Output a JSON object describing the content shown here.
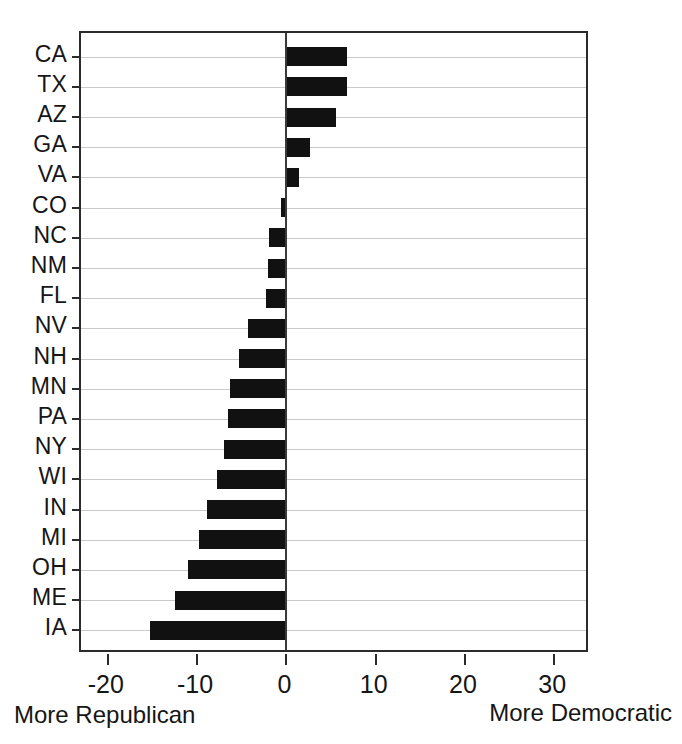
{
  "chart_data": {
    "type": "bar",
    "orientation": "horizontal",
    "title": "",
    "subtitle": "",
    "xlabel": "",
    "ylabel": "",
    "xlim": [
      -23,
      34
    ],
    "ylim": null,
    "grid": true,
    "legend": null,
    "xticks": [
      -20,
      -10,
      0,
      10,
      20,
      30
    ],
    "xticklabels": [
      "-20",
      "-10",
      "0",
      "10",
      "20",
      "30"
    ],
    "categories": [
      "CA",
      "TX",
      "AZ",
      "GA",
      "VA",
      "CO",
      "NC",
      "NM",
      "FL",
      "NV",
      "NH",
      "MN",
      "PA",
      "NY",
      "WI",
      "IN",
      "MI",
      "OH",
      "ME",
      "IA"
    ],
    "values": [
      6.8,
      6.8,
      5.6,
      2.7,
      1.4,
      -0.6,
      -1.9,
      -2.1,
      -2.3,
      -4.3,
      -5.3,
      -6.3,
      -6.5,
      -7.0,
      -7.8,
      -8.9,
      -9.8,
      -11.0,
      -12.5,
      -15.3
    ],
    "bar_color": "#111111",
    "annotations": {
      "left_caption": "More Republican",
      "right_caption": "More Democratic"
    }
  },
  "axis": {
    "left_caption": "More Republican",
    "right_caption": "More Democratic"
  }
}
